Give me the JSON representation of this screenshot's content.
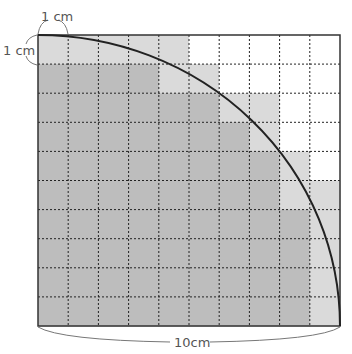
{
  "diagram": {
    "labels": {
      "top_cell_width": "1 cm",
      "left_cell_height": "1 cm",
      "bottom_side": "10cm"
    },
    "grid": {
      "rows": 10,
      "cols": 10
    },
    "colors": {
      "dark": "#bdbdbd",
      "light": "#dadada",
      "white": "#ffffff",
      "line": "#222222"
    },
    "shading": [
      "LLLLLWWWWW",
      "DDDDLLWWWW",
      "DDDDDDLLWW",
      "DDDDDDDLWW",
      "DDDDDDDDLW",
      "DDDDDDDDLL",
      "DDDDDDDDDL",
      "DDDDDDDDDL",
      "DDDDDDDDDL",
      "DDDDDDDDDL"
    ],
    "arc": "quarter circle of radius 10cm centered at bottom-left corner"
  }
}
